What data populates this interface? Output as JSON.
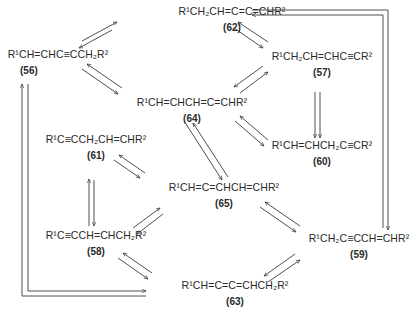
{
  "diagram": {
    "type": "isomerization network",
    "compounds": [
      {
        "id": "62",
        "formula": "R¹CH₂CH=C=C=CHR²",
        "label": "(62)"
      },
      {
        "id": "56",
        "formula": "R¹CH=CHC≡CCH₂R²",
        "label": "(56)"
      },
      {
        "id": "57",
        "formula": "R¹CH₂CH=CHC≡CR²",
        "label": "(57)"
      },
      {
        "id": "64",
        "formula": "R¹CH=CHCH=C=CHR²",
        "label": "(64)"
      },
      {
        "id": "60",
        "formula": "R¹CH=CHCH₂C≡CR²",
        "label": "(60)"
      },
      {
        "id": "61",
        "formula": "R¹C≡CCH₂CH=CHR²",
        "label": "(61)"
      },
      {
        "id": "65",
        "formula": "R¹CH=C=CHCH=CHR²",
        "label": "(65)"
      },
      {
        "id": "58",
        "formula": "R¹C≡CCH=CHCH₂R²",
        "label": "(58)"
      },
      {
        "id": "59",
        "formula": "R¹CH₂C≡CCH=CHR²",
        "label": "(59)"
      },
      {
        "id": "63",
        "formula": "R¹CH=C=C=CHCH₂R²",
        "label": "(63)"
      }
    ],
    "equilibria": [
      [
        "56",
        "62"
      ],
      [
        "62",
        "57"
      ],
      [
        "56",
        "64"
      ],
      [
        "57",
        "64"
      ],
      [
        "57",
        "60"
      ],
      [
        "64",
        "60"
      ],
      [
        "64",
        "65"
      ],
      [
        "61",
        "65"
      ],
      [
        "61",
        "58"
      ],
      [
        "65",
        "58"
      ],
      [
        "65",
        "59"
      ],
      [
        "58",
        "63"
      ],
      [
        "59",
        "63"
      ],
      [
        "62",
        "59"
      ],
      [
        "63",
        "56"
      ]
    ]
  }
}
